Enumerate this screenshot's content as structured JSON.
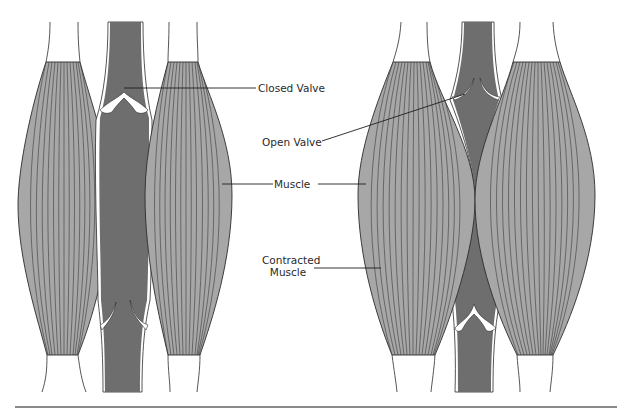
{
  "figure": {
    "panels": [
      {
        "name": "relaxed",
        "description": "Relaxed muscles: upper valve closed, lower valve open"
      },
      {
        "name": "contracted",
        "description": "Contracted muscles squeeze vein: upper valve open, lower valve closed"
      }
    ]
  },
  "labels": {
    "closed_valve": "Closed Valve",
    "open_valve": "Open Valve",
    "muscle": "Muscle",
    "contracted_muscle_line1": "Contracted",
    "contracted_muscle_line2": "Muscle"
  },
  "colors": {
    "muscle_fill": "#a7a7a7",
    "muscle_stroke": "#2b2b2b",
    "vein_fill": "#6e6e6e",
    "tendon_fill": "#ffffff",
    "divider": "#8a8a8a",
    "background": "#ffffff"
  }
}
